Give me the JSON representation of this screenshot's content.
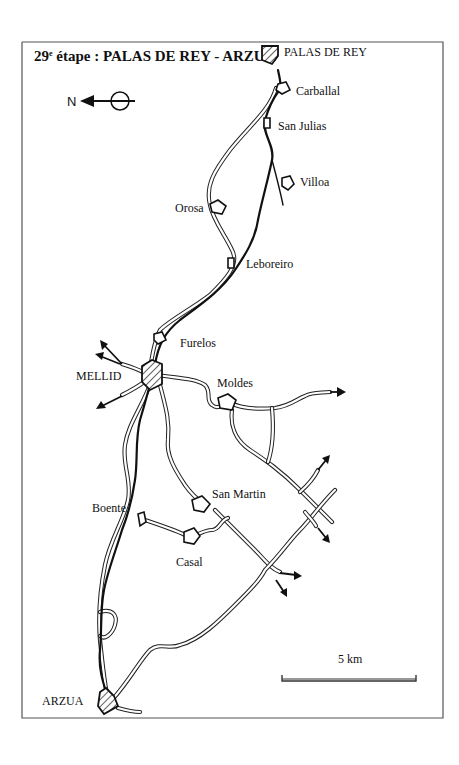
{
  "title": {
    "prefix": "29",
    "superscript": "e",
    "text": " étape : PALAS DE REY - ARZUA"
  },
  "compass": {
    "label": "N",
    "icon": "north-arrow-icon"
  },
  "scale": {
    "label": "5 km"
  },
  "places": {
    "palas_de_rey": "PALAS DE REY",
    "carballal": "Carballal",
    "san_julias": "San Julias",
    "villoa": "Villoa",
    "orosa": "Orosa",
    "leboreiro": "Leboreiro",
    "furelos": "Furelos",
    "mellid": "MELLID",
    "moldes": "Moldes",
    "san_martin": "San Martin",
    "boente": "Boente",
    "casal": "Casal",
    "arzua": "ARZUA"
  },
  "legend_symbols": {
    "town": "hatched-polygon (major town)",
    "village": "white-polygon (village)",
    "route": "thick black line (pilgrim path)",
    "road": "double line (road)",
    "exit": "arrow (road continues off-map)"
  },
  "colors": {
    "ink": "#111111",
    "paper": "#ffffff",
    "frame": "#555555"
  }
}
